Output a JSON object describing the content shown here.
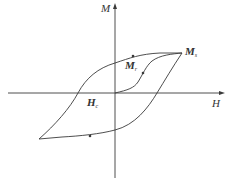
{
  "diagram": {
    "type": "hysteresis-loop",
    "axes": {
      "x_label": "H",
      "y_label": "M"
    },
    "points": {
      "saturation": {
        "main": "M",
        "sub": "s"
      },
      "remanence": {
        "main": "M",
        "sub": "r"
      },
      "coercivity": {
        "main": "H",
        "sub": "c"
      }
    },
    "colors": {
      "line": "#3a3a3a",
      "text": "#333333",
      "background": "#ffffff"
    }
  }
}
